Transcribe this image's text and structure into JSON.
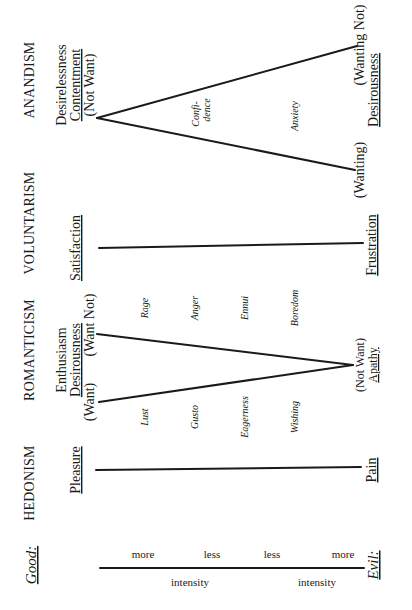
{
  "diagram": {
    "good_label": "Good:",
    "evil_label": "Evil:",
    "axis": {
      "labels_top": [
        "more",
        "less",
        "less",
        "more"
      ],
      "labels_bottom": [
        "intensity",
        "intensity"
      ]
    },
    "columns": [
      {
        "heading": "HEDONISM",
        "top": {
          "label": "Pleasure"
        },
        "bottom": {
          "label": "Pain"
        }
      },
      {
        "heading": "ROMANTICISM",
        "top": {
          "line1": "Enthusiasm",
          "line2": "Desirousness",
          "left": "(Want)",
          "right": "(Want Not)"
        },
        "bottom": {
          "paren": "(Not Want)",
          "label": "Apathy"
        },
        "left_terms": [
          "Lust",
          "Gusto",
          "Eagerness",
          "Wishing"
        ],
        "right_terms": [
          "Rage",
          "Anger",
          "Ennui",
          "Boredom"
        ]
      },
      {
        "heading": "VOLUNTARISM",
        "top": {
          "label": "Satisfaction"
        },
        "bottom": {
          "label": "Frustration"
        }
      },
      {
        "heading": "ANANDISM",
        "top": {
          "line1": "Desirelessness",
          "line2": "Contentment",
          "paren": "(Not Want)"
        },
        "bottom": {
          "left": "(Wanting)",
          "right": "(Wanting Not)",
          "label": "Desirousness"
        },
        "inner_terms": [
          "Confi-",
          "dence",
          "Anxiety"
        ]
      }
    ]
  }
}
